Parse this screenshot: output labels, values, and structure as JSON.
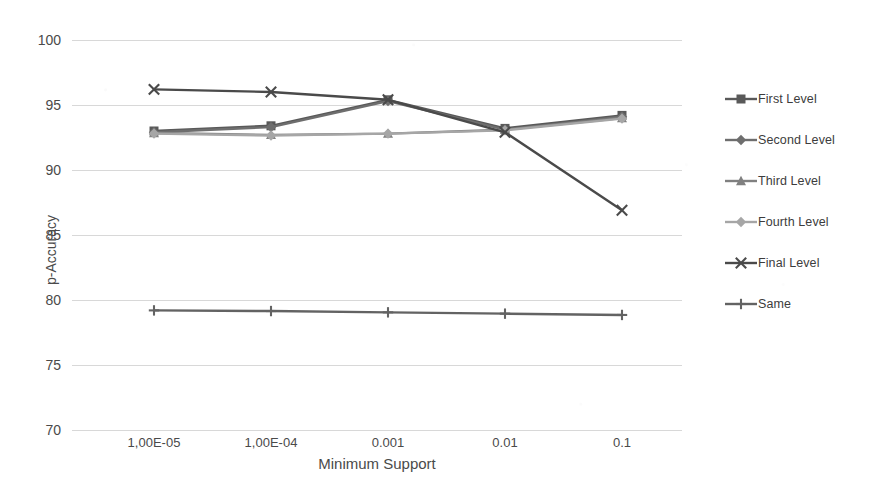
{
  "chart_data": {
    "type": "line",
    "title": "",
    "xlabel": "Minimum Support",
    "ylabel": "p-Accuracy",
    "categories": [
      "1,00E-05",
      "1,00E-04",
      "0.001",
      "0.01",
      "0.1"
    ],
    "ylim": [
      70,
      100
    ],
    "ytick_values": [
      70,
      75,
      80,
      85,
      90,
      95,
      100
    ],
    "ytick_labels": [
      "70",
      "75",
      "80",
      "85",
      "90",
      "95",
      "100"
    ],
    "grid": true,
    "legend_position": "right",
    "series": [
      {
        "name": "First Level",
        "marker": "square",
        "color": "#595959",
        "values": [
          93.0,
          93.4,
          95.4,
          93.2,
          94.2
        ]
      },
      {
        "name": "Second Level",
        "marker": "diamond",
        "color": "#6e6e6e",
        "values": [
          92.9,
          93.3,
          95.3,
          93.1,
          94.1
        ]
      },
      {
        "name": "Third Level",
        "marker": "triangle",
        "color": "#808080",
        "values": [
          92.85,
          92.7,
          92.8,
          93.1,
          94.0
        ]
      },
      {
        "name": "Fourth Level",
        "marker": "diamond",
        "color": "#a6a6a6",
        "values": [
          92.8,
          92.65,
          92.8,
          93.05,
          93.95
        ]
      },
      {
        "name": "Final Level",
        "marker": "x",
        "color": "#4a4a4a",
        "values": [
          96.2,
          96.0,
          95.4,
          92.9,
          86.9
        ]
      },
      {
        "name": "Same",
        "marker": "plus",
        "color": "#636363",
        "values": [
          79.2,
          79.15,
          79.05,
          78.95,
          78.85
        ]
      }
    ]
  },
  "axis": {
    "y_title": "p-Accuracy",
    "x_title": "Minimum Support",
    "y_ticks": [
      "100",
      "95",
      "90",
      "85",
      "80",
      "75",
      "70"
    ],
    "x_ticks": [
      "1,00E-05",
      "1,00E-04",
      "0.001",
      "0.01",
      "0.1"
    ]
  },
  "legend": {
    "items": [
      {
        "label": "First Level"
      },
      {
        "label": "Second Level"
      },
      {
        "label": "Third Level"
      },
      {
        "label": "Fourth Level"
      },
      {
        "label": "Final Level"
      },
      {
        "label": "Same"
      }
    ]
  },
  "colors": {
    "grid": "#d8d8d8",
    "text": "#4a4a4a",
    "background": "#ffffff"
  },
  "header": {
    "clipped_title": ""
  }
}
